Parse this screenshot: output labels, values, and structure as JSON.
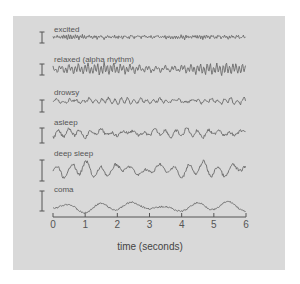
{
  "figure": {
    "traces": [
      {
        "label": "excited",
        "label_y": 25,
        "baseline": 37,
        "amp": 1.6,
        "freq": 14,
        "noise": 1.0,
        "scale_top": 32,
        "scale_bot": 43
      },
      {
        "label": "relaxed (alpha rhythm)",
        "label_y": 55,
        "baseline": 69,
        "amp": 4.5,
        "freq": 10,
        "noise": 0.8,
        "scale_top": 64,
        "scale_bot": 75
      },
      {
        "label": "drowsy",
        "label_y": 88,
        "baseline": 101,
        "amp": 2.5,
        "freq": 5,
        "noise": 1.2,
        "scale_top": 100,
        "scale_bot": 112
      },
      {
        "label": "asleep",
        "label_y": 118,
        "baseline": 133,
        "amp": 3.5,
        "freq": 3,
        "noise": 1.5,
        "scale_top": 128,
        "scale_bot": 143
      },
      {
        "label": "deep sleep",
        "label_y": 149,
        "baseline": 170,
        "amp": 6.5,
        "freq": 2.2,
        "noise": 1.5,
        "scale_top": 160,
        "scale_bot": 181
      },
      {
        "label": "coma",
        "label_y": 185,
        "baseline": 207,
        "amp": 4.5,
        "freq": 1.0,
        "noise": 0.8,
        "scale_top": 191,
        "scale_bot": 211
      }
    ],
    "axis": {
      "ticks": [
        "0",
        "1",
        "2",
        "3",
        "4",
        "5",
        "6"
      ],
      "xlabel": "time (seconds)"
    },
    "colors": {
      "panel": "#d9d9d9",
      "trace": "#6a6a6a",
      "text": "#555555"
    }
  },
  "chart_data": {
    "type": "line",
    "title": "",
    "xlabel": "time (seconds)",
    "ylabel": "",
    "xlim": [
      0,
      6
    ],
    "x_ticks": [
      0,
      1,
      2,
      3,
      4,
      5,
      6
    ],
    "series": [
      {
        "name": "excited",
        "description": "low amplitude, high frequency"
      },
      {
        "name": "relaxed (alpha rhythm)",
        "description": "regular ~10 Hz oscillation"
      },
      {
        "name": "drowsy",
        "description": "mixed, moderate amplitude"
      },
      {
        "name": "asleep",
        "description": "slower waves with spindles"
      },
      {
        "name": "deep sleep",
        "description": "high amplitude slow waves"
      },
      {
        "name": "coma",
        "description": "very slow low-frequency waves"
      }
    ],
    "grid": false,
    "legend": "inline labels above each trace"
  }
}
